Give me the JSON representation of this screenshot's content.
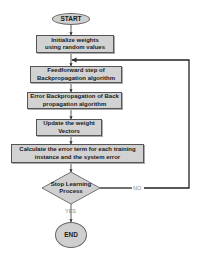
{
  "flowchart": {
    "start": "START",
    "end": "END",
    "steps": [
      "Initialize weights using random values",
      "Feedforward step of Backpropagation algorithm",
      "Error Backpropagation of Back propagation algorithm",
      "Update the weight Vectors",
      "Calculate the error term for each training instance and the system error"
    ],
    "decision": "Stop Learning Process",
    "yes_label": "YES",
    "no_label": "NO"
  },
  "colors": {
    "fill": "#d2d2d2",
    "stroke": "#555555",
    "line": "#222222",
    "label": "#8a8a8a"
  }
}
